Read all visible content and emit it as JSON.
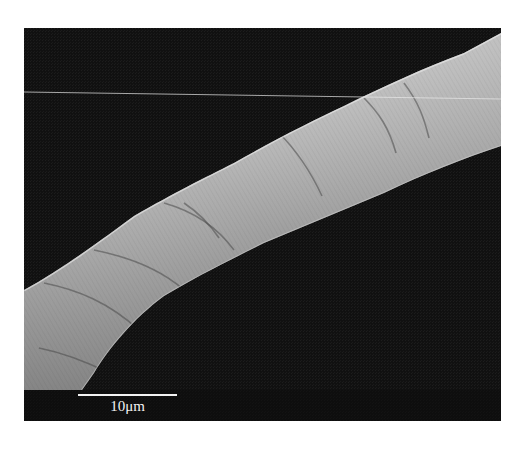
{
  "figure": {
    "type": "SEM micrograph",
    "background_color": "#111111",
    "page_color": "#ffffff"
  },
  "scale_bar": {
    "label": "10μm",
    "color": "#f2f2f2"
  }
}
